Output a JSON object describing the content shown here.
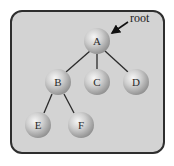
{
  "diagram": {
    "type": "tree",
    "root_annotation": "root",
    "nodes": [
      {
        "id": "A",
        "label": "A",
        "x": 97,
        "y": 41
      },
      {
        "id": "B",
        "label": "B",
        "x": 58,
        "y": 82
      },
      {
        "id": "C",
        "label": "C",
        "x": 97,
        "y": 82
      },
      {
        "id": "D",
        "label": "D",
        "x": 136,
        "y": 82
      },
      {
        "id": "E",
        "label": "E",
        "x": 38,
        "y": 125
      },
      {
        "id": "F",
        "label": "F",
        "x": 81,
        "y": 125
      }
    ],
    "edges": [
      {
        "from": "A",
        "to": "B"
      },
      {
        "from": "A",
        "to": "C"
      },
      {
        "from": "A",
        "to": "D"
      },
      {
        "from": "B",
        "to": "E"
      },
      {
        "from": "B",
        "to": "F"
      }
    ],
    "colors": {
      "background": "#d3d3d3",
      "border": "#2e2e2e",
      "node_highlight": "#f4f4f4",
      "node_shadow": "#8a8a8a",
      "edge": "#2a2a2a"
    }
  }
}
